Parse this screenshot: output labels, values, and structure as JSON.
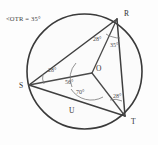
{
  "figure": {
    "caption": "<OTR = 35°",
    "background_color": "#fdfdfd",
    "stroke_color": "#3a3a3a"
  },
  "circle": {
    "center_label": "O",
    "region_label": "U",
    "cx": 84.5,
    "cy": 71.5,
    "r": 57.5
  },
  "points": [
    {
      "id": "R",
      "label": "R",
      "x": 117,
      "y": 19,
      "label_x": 124,
      "label_y": 16
    },
    {
      "id": "S",
      "label": "S",
      "x": 29,
      "y": 85,
      "label_x": 19,
      "label_y": 88
    },
    {
      "id": "T",
      "label": "T",
      "x": 125,
      "y": 116,
      "label_x": 131,
      "label_y": 124
    },
    {
      "id": "O",
      "label": "O",
      "x": 92,
      "y": 73,
      "label_x": 96,
      "label_y": 71
    },
    {
      "id": "U",
      "label": "U",
      "x": 72,
      "y": 110,
      "label_x": 69,
      "label_y": 113
    }
  ],
  "segments": [
    {
      "name": "chord-SR",
      "from": "S",
      "to": "R",
      "kind": "chord"
    },
    {
      "name": "chord-RT",
      "from": "R",
      "to": "T",
      "kind": "chord"
    },
    {
      "name": "chord-ST",
      "from": "S",
      "to": "T",
      "kind": "chord"
    },
    {
      "name": "radius-OR",
      "from": "O",
      "to": "R",
      "kind": "radius"
    },
    {
      "name": "radius-OS",
      "from": "O",
      "to": "S",
      "kind": "radius"
    },
    {
      "name": "radius-OT",
      "from": "O",
      "to": "T",
      "kind": "radius"
    }
  ],
  "angles": [
    {
      "name": "angle-at-R-SRO",
      "vertex": "R",
      "value": "28°",
      "label_x": 93,
      "label_y": 41
    },
    {
      "name": "angle-at-R-ORT",
      "vertex": "R",
      "value": "35°",
      "label_x": 110,
      "label_y": 47
    },
    {
      "name": "angle-at-S-RSO",
      "vertex": "S",
      "value": "28°",
      "label_x": 48,
      "label_y": 72
    },
    {
      "name": "angle-at-O-SOR",
      "vertex": "O",
      "value": "56°",
      "label_x": 65,
      "label_y": 84
    },
    {
      "name": "angle-at-O-SOT",
      "vertex": "O",
      "value": "70°",
      "label_x": 76,
      "label_y": 94
    },
    {
      "name": "angle-at-T-OTR",
      "vertex": "T",
      "value": "28°",
      "label_x": 113,
      "label_y": 98
    }
  ]
}
